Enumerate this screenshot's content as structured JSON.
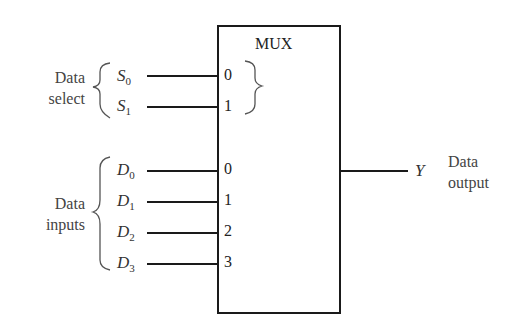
{
  "mux": {
    "title": "MUX",
    "select_group_label_line1": "Data",
    "select_group_label_line2": "select",
    "select_signals": [
      {
        "name": "S",
        "sub": "0",
        "pin": "0"
      },
      {
        "name": "S",
        "sub": "1",
        "pin": "1"
      }
    ],
    "input_group_label_line1": "Data",
    "input_group_label_line2": "inputs",
    "input_signals": [
      {
        "name": "D",
        "sub": "0",
        "pin": "0"
      },
      {
        "name": "D",
        "sub": "1",
        "pin": "1"
      },
      {
        "name": "D",
        "sub": "2",
        "pin": "2"
      },
      {
        "name": "D",
        "sub": "3",
        "pin": "3"
      }
    ],
    "output_signal": "Y",
    "output_label_line1": "Data",
    "output_label_line2": "output"
  }
}
